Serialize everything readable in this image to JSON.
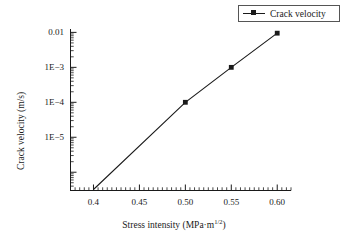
{
  "chart_data": {
    "type": "line",
    "title": "",
    "xlabel": "Stress intensity (MPa·m1/2)",
    "xlabel_base": "Stress intensity (MPa·m",
    "xlabel_sup": "1/2",
    "xlabel_tail": ")",
    "ylabel": "Crack velocity (m/s)",
    "yscale": "log",
    "xscale": "linear",
    "xlim": [
      0.375,
      0.615
    ],
    "ylim": [
      3e-07,
      0.0125
    ],
    "grid": false,
    "legend_position": "top-right",
    "xticks": [
      0.4,
      0.45,
      0.5,
      0.55,
      0.6
    ],
    "xtick_labels": [
      "0.4",
      "0.45",
      "0.50",
      "0.55",
      "0.60"
    ],
    "yticks": [
      0.01,
      0.001,
      0.0001,
      1e-05
    ],
    "ytick_labels": [
      "0.01",
      "1E−3",
      "1E−4",
      "1E−5"
    ],
    "series": [
      {
        "name": "Crack velocity",
        "color": "#1a1a1a",
        "marker": "square",
        "x": [
          0.4,
          0.5,
          0.55,
          0.6
        ],
        "y": [
          3.2e-07,
          0.0001,
          0.001,
          0.0095
        ],
        "marker_x": [
          0.5,
          0.55,
          0.6
        ],
        "marker_y": [
          0.0001,
          0.001,
          0.0095
        ]
      }
    ]
  },
  "legend": {
    "entries": [
      {
        "label": "Crack velocity",
        "marker": "square-marker-icon"
      }
    ]
  },
  "axes": {
    "x_title": "Stress intensity (MPa·m1/2)",
    "y_title": "Crack velocity (m/s)"
  }
}
